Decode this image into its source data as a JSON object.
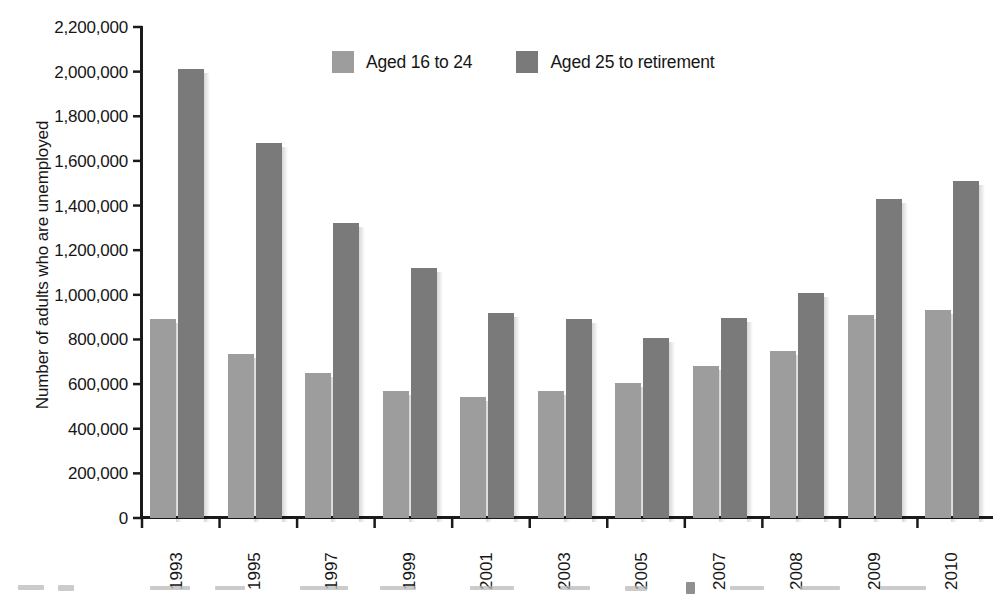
{
  "chart_data": {
    "type": "bar",
    "title": "",
    "xlabel": "",
    "ylabel": "Number of adults who are unemployed",
    "categories": [
      "1993",
      "1995",
      "1997",
      "1999",
      "2001",
      "2003",
      "2005",
      "2007",
      "2008",
      "2009",
      "2010"
    ],
    "series": [
      {
        "name": "Aged 16 to 24",
        "color": "#9d9d9d",
        "values": [
          890000,
          733000,
          650000,
          570000,
          540000,
          570000,
          605000,
          680000,
          750000,
          910000,
          930000
        ]
      },
      {
        "name": "Aged 25 to retirement",
        "color": "#7a7a7a",
        "values": [
          2010000,
          1680000,
          1320000,
          1120000,
          920000,
          890000,
          805000,
          898000,
          1010000,
          1430000,
          1510000
        ]
      }
    ],
    "ylim": [
      0,
      2200000
    ],
    "ytick_step": 200000,
    "ytick_labels": [
      "2,200,000",
      "2,000,000",
      "1,800,000",
      "1,600,000",
      "1,400,000",
      "1,200,000",
      "1,000,000",
      "800,000",
      "600,000",
      "400,000",
      "200,000",
      "0"
    ],
    "grid": false,
    "legend_position": "top-center"
  },
  "legend": {
    "entries": [
      {
        "label": "Aged 16 to 24",
        "swatch": "legend-swatch-young"
      },
      {
        "label": "Aged 25 to retirement",
        "swatch": "legend-swatch-adult"
      }
    ]
  },
  "axis": {
    "y_title": "Number of adults who are unemployed"
  }
}
